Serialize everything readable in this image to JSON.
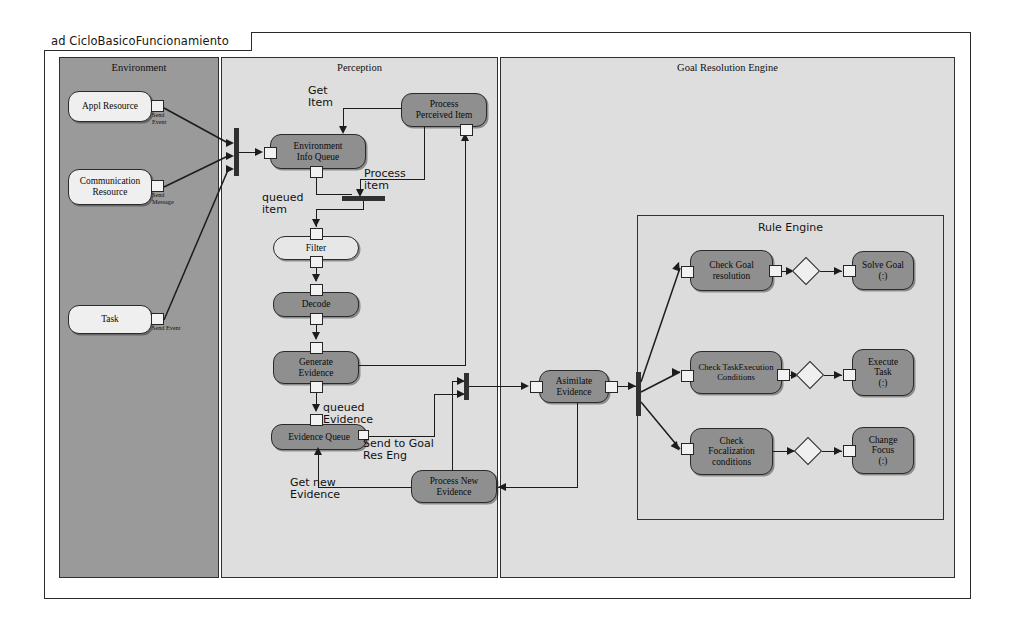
{
  "diagram": {
    "frame_label": "ad CicloBasicoFuncionamiento",
    "type": "uml-activity-diagram"
  },
  "partitions": {
    "environment": {
      "title": "Environment"
    },
    "perception": {
      "title": "Perception"
    },
    "goal_resolution_engine": {
      "title": "Goal Resolution Engine"
    },
    "rule_engine": {
      "title": "Rule Engine"
    }
  },
  "nodes": {
    "appl_resource": "Appl Resource",
    "communication_resource": "Communication\nResource",
    "task": "Task",
    "environment_info_queue": "Environment\nInfo Queue",
    "process_perceived_item": "Process\nPerceived Item",
    "filter": "Filter",
    "decode": "Decode",
    "generate_evidence": "Generate\nEvidence",
    "evidence_queue": "Evidence Queue",
    "process_new_evidence": "Process New\nEvidence",
    "asimilate_evidence": "Asimilate\nEvidence",
    "check_goal_resolution": "Check Goal\nresolution",
    "solve_goal": "Solve Goal\n(:)",
    "check_task_execution_conditions": "Check TaskExecution\nConditions",
    "execute_task": "Execute\nTask\n(:)",
    "check_focalization_conditions": "Check\nFocalization\nconditions",
    "change_focus": "Change\nFocus\n(:)"
  },
  "pin_labels": {
    "appl_resource_send_event": "Send\nEvent",
    "communication_resource_send_message": "Send\nMessage",
    "task_send_event": "Send Event"
  },
  "edge_labels": {
    "get_item": "Get\nItem",
    "process_item": "Process\nitem",
    "queued_item": "queued\nitem",
    "queued_evidence": "queued\nEvidence",
    "send_to_goal_res_eng": "Send to Goal\nRes Eng",
    "get_new_evidence": "Get new\nEvidence"
  },
  "colors": {
    "environment_fill": "#9a9a9a",
    "partition_fill": "#dedede",
    "rule_engine_fill": "#dcdcdc",
    "action_fill": "#8f8f8f",
    "queue_fill": "#e7e7e7",
    "line": "#1c1c1c",
    "frame_border": "#2b2b2b"
  }
}
